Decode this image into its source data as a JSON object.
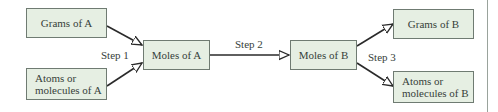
{
  "diagram": {
    "type": "flowchart",
    "nodes": [
      {
        "id": "grams_a",
        "label": "Grams of A"
      },
      {
        "id": "atoms_a",
        "label_line1": "Atoms or",
        "label_line2": "molecules of A"
      },
      {
        "id": "moles_a",
        "label": "Moles of A"
      },
      {
        "id": "moles_b",
        "label": "Moles of B"
      },
      {
        "id": "grams_b",
        "label": "Grams of B"
      },
      {
        "id": "atoms_b",
        "label_line1": "Atoms or",
        "label_line2": "molecules of B"
      }
    ],
    "steps": {
      "step1": "Step 1",
      "step2": "Step 2",
      "step3": "Step 3"
    },
    "edges": [
      {
        "from": "grams_a",
        "to": "moles_a",
        "step": "Step 1"
      },
      {
        "from": "atoms_a",
        "to": "moles_a",
        "step": "Step 1"
      },
      {
        "from": "moles_a",
        "to": "moles_b",
        "step": "Step 2"
      },
      {
        "from": "moles_b",
        "to": "grams_b",
        "step": "Step 3"
      },
      {
        "from": "moles_b",
        "to": "atoms_b",
        "step": "Step 3"
      }
    ],
    "colors": {
      "box_fill": "#e6efe3",
      "box_border": "#6f7b72",
      "line": "#2a2a2a",
      "text": "#36413a"
    }
  }
}
